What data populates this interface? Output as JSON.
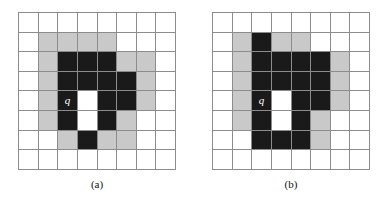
{
  "figure": {
    "panels": [
      {
        "id": "panel-a",
        "caption": "(a)",
        "marker_label": "q",
        "marker_row": 4,
        "marker_col": 2,
        "rows": 8,
        "cols": 8,
        "cells": [
          [
            "white",
            "white",
            "white",
            "white",
            "white",
            "white",
            "white",
            "white"
          ],
          [
            "white",
            "gray",
            "gray",
            "gray",
            "gray",
            "white",
            "white",
            "white"
          ],
          [
            "white",
            "gray",
            "black",
            "black",
            "black",
            "gray",
            "gray",
            "white"
          ],
          [
            "white",
            "gray",
            "black",
            "black",
            "black",
            "black",
            "gray",
            "white"
          ],
          [
            "white",
            "gray",
            "black",
            "white",
            "black",
            "black",
            "gray",
            "white"
          ],
          [
            "white",
            "gray",
            "black",
            "white",
            "black",
            "gray",
            "white",
            "white"
          ],
          [
            "white",
            "white",
            "gray",
            "black",
            "gray",
            "gray",
            "white",
            "white"
          ],
          [
            "white",
            "white",
            "white",
            "white",
            "white",
            "white",
            "white",
            "white"
          ]
        ]
      },
      {
        "id": "panel-b",
        "caption": "(b)",
        "marker_label": "q",
        "marker_row": 4,
        "marker_col": 2,
        "rows": 8,
        "cols": 8,
        "cells": [
          [
            "white",
            "white",
            "white",
            "white",
            "white",
            "white",
            "white",
            "white"
          ],
          [
            "white",
            "gray",
            "black",
            "gray",
            "gray",
            "white",
            "white",
            "white"
          ],
          [
            "white",
            "gray",
            "black",
            "black",
            "black",
            "black",
            "gray",
            "white"
          ],
          [
            "white",
            "gray",
            "black",
            "black",
            "black",
            "black",
            "gray",
            "white"
          ],
          [
            "white",
            "gray",
            "black",
            "white",
            "black",
            "black",
            "gray",
            "white"
          ],
          [
            "white",
            "gray",
            "black",
            "white",
            "black",
            "gray",
            "white",
            "white"
          ],
          [
            "white",
            "white",
            "black",
            "black",
            "black",
            "gray",
            "white",
            "white"
          ],
          [
            "white",
            "white",
            "white",
            "white",
            "white",
            "white",
            "white",
            "white"
          ]
        ]
      }
    ],
    "colors": {
      "white": "#ffffff",
      "gray": "#c9c9c9",
      "black": "#1a1a1a",
      "gridline": "#8c8c8c",
      "label_text": "#ffffff",
      "caption_text": "#111111"
    }
  }
}
